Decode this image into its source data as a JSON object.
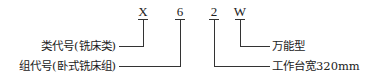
{
  "codes": [
    "X",
    "6",
    "2",
    "W"
  ],
  "labels": {
    "class_code": "类代号(铣床类)",
    "group_code": "组代号(卧式铣床组)",
    "universal": "万能型",
    "table_width": "工作台宽320mm"
  }
}
